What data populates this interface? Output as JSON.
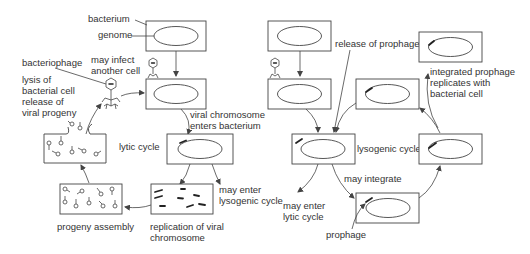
{
  "labels": {
    "bacterium": "bacterium",
    "genome": "genome",
    "bacteriophage": "bacteriophage",
    "may_infect_1": "may infect",
    "may_infect_2": "another cell",
    "lysis_1": "lysis of",
    "lysis_2": "bacterial cell",
    "lysis_3": "release of",
    "lysis_4": "viral progeny",
    "viral_chrom_1": "viral chromosome",
    "viral_chrom_2": "enters bacterium",
    "lytic_cycle": "lytic cycle",
    "may_enter_lyso_1": "may enter",
    "may_enter_lyso_2": "lysogenic cycle",
    "progeny_assembly": "progeny assembly",
    "replication_1": "replication of viral",
    "replication_2": "chromosome",
    "release_prophage": "release of prophage",
    "integrated_1": "integrated prophage",
    "integrated_2": "replicates with",
    "integrated_3": "bacterial cell",
    "lysogenic_cycle": "lysogenic cycle",
    "may_integrate": "may integrate",
    "may_enter_lytic_1": "may enter",
    "may_enter_lytic_2": "lytic cycle",
    "prophage": "prophage"
  },
  "colors": {
    "stroke": "#444444",
    "text": "#333333",
    "background": "#ffffff"
  }
}
